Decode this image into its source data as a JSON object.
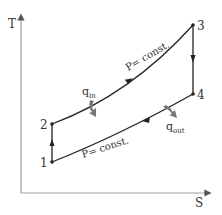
{
  "diagram": {
    "type": "T-s diagram (Brayton cycle)",
    "axes": {
      "y_label": "T",
      "x_label": "S"
    },
    "points": [
      {
        "id": "1",
        "label": "1"
      },
      {
        "id": "2",
        "label": "2"
      },
      {
        "id": "3",
        "label": "3"
      },
      {
        "id": "4",
        "label": "4"
      }
    ],
    "processes": {
      "upper": {
        "label": "P= const.",
        "from": "2",
        "to": "3"
      },
      "lower": {
        "label": "P= const.",
        "from": "4",
        "to": "1"
      }
    },
    "heat": {
      "in": {
        "base": "q",
        "sub": "in"
      },
      "out": {
        "base": "q",
        "sub": "out"
      }
    },
    "colors": {
      "line": "#222222",
      "axis": "#999999",
      "heat_arrow": "#777777"
    }
  }
}
